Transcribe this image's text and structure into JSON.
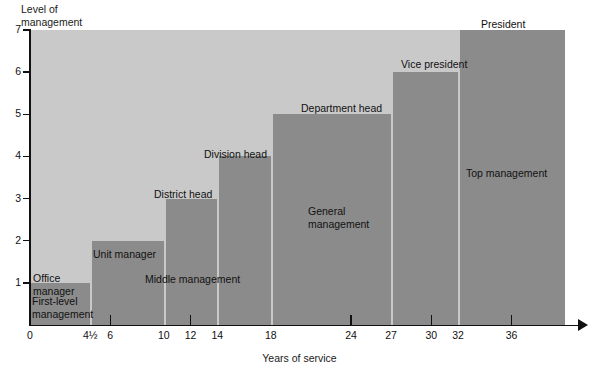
{
  "chart_data": {
    "type": "bar",
    "title": "",
    "xlabel": "Years of service",
    "ylabel": "Level of\nmanagement",
    "xlim": [
      0,
      40
    ],
    "ylim": [
      0,
      7
    ],
    "grid": false,
    "legend": "none",
    "x_ticks": [
      {
        "value": 0,
        "label": "0",
        "tick_mark": true
      },
      {
        "value": 4.5,
        "label": "4½",
        "tick_mark": false
      },
      {
        "value": 6,
        "label": "6",
        "tick_mark": true
      },
      {
        "value": 10,
        "label": "10",
        "tick_mark": false
      },
      {
        "value": 12,
        "label": "12",
        "tick_mark": true
      },
      {
        "value": 14,
        "label": "14",
        "tick_mark": false
      },
      {
        "value": 18,
        "label": "18",
        "tick_mark": false
      },
      {
        "value": 24,
        "label": "24",
        "tick_mark": true
      },
      {
        "value": 27,
        "label": "27",
        "tick_mark": false
      },
      {
        "value": 30,
        "label": "30",
        "tick_mark": true
      },
      {
        "value": 32,
        "label": "32",
        "tick_mark": false
      },
      {
        "value": 36,
        "label": "36",
        "tick_mark": true
      }
    ],
    "y_ticks": [
      {
        "value": 1,
        "label": "1"
      },
      {
        "value": 2,
        "label": "2"
      },
      {
        "value": 3,
        "label": "3"
      },
      {
        "value": 4,
        "label": "4"
      },
      {
        "value": 5,
        "label": "5"
      },
      {
        "value": 6,
        "label": "6"
      },
      {
        "value": 7,
        "label": "7"
      }
    ],
    "bars": [
      {
        "label": "Office\nmanager",
        "x_start": 0,
        "x_end": 4.5,
        "value": 1
      },
      {
        "label": "Unit manager",
        "x_start": 4.5,
        "x_end": 10,
        "value": 2
      },
      {
        "label": "District head",
        "x_start": 10,
        "x_end": 14,
        "value": 3
      },
      {
        "label": "Division head",
        "x_start": 14,
        "x_end": 18,
        "value": 4
      },
      {
        "label": "Department head",
        "x_start": 18,
        "x_end": 27,
        "value": 5
      },
      {
        "label": "Vice president",
        "x_start": 27,
        "x_end": 32,
        "value": 6
      },
      {
        "label": "President",
        "x_start": 32,
        "x_end": 40,
        "value": 7
      }
    ],
    "zones": [
      {
        "label": "First-level\nmanagement",
        "x_start": 0,
        "x_end": 4.5,
        "y_top": 1
      },
      {
        "label": "Middle management",
        "x_start": 4.5,
        "x_end": 18,
        "y_top": 4
      },
      {
        "label": "General\nmanagement",
        "x_start": 18,
        "x_end": 27,
        "y_top": 5
      },
      {
        "label": "Top management",
        "x_start": 27,
        "x_end": 40,
        "y_top": 7
      }
    ],
    "colors": {
      "plot_background": "#c9c9c9",
      "bar_fill": "#8b8b8b",
      "axis": "#111111",
      "text": "#111111",
      "page_background": "#ffffff"
    }
  },
  "bar_label_positions": [
    {
      "left": 3,
      "top": 242
    },
    {
      "left": 63,
      "top": 218
    },
    {
      "left": 124,
      "top": 158
    },
    {
      "left": 174,
      "top": 118
    },
    {
      "left": 271,
      "top": 72
    },
    {
      "left": 371,
      "top": 28
    },
    {
      "left": 451,
      "top": -12
    }
  ],
  "zone_label_positions": [
    {
      "left": 2,
      "top": 265
    },
    {
      "left": 115,
      "top": 243
    },
    {
      "left": 278,
      "top": 175
    },
    {
      "left": 436,
      "top": 137
    }
  ]
}
